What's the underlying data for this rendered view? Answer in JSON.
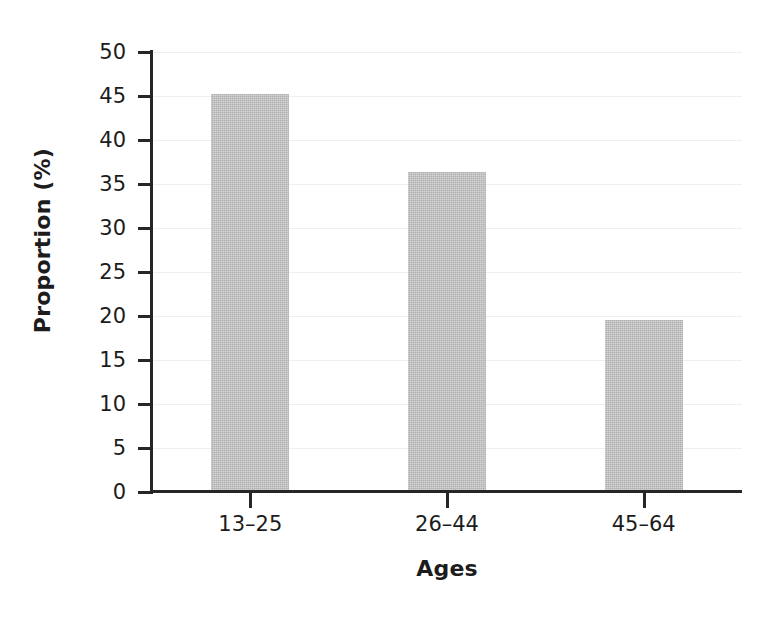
{
  "chart_data": {
    "type": "bar",
    "title": "",
    "subtitle": "",
    "categories": [
      "13–25",
      "26–44",
      "45–64"
    ],
    "values": [
      45.2,
      36.4,
      19.5
    ],
    "xlabel": "Ages",
    "ylabel": "Proportion (%)",
    "ylim": [
      0,
      50
    ],
    "ytick_labels": [
      "0",
      "5",
      "10",
      "15",
      "20",
      "25",
      "30",
      "35",
      "40",
      "45",
      "50"
    ],
    "ytick_values": [
      0,
      5,
      10,
      15,
      20,
      25,
      30,
      35,
      40,
      45,
      50
    ],
    "grid": true,
    "legend": "none",
    "bar_color": "#bdbdbd",
    "axis_color": "#262626",
    "grid_color": "#f1efed",
    "background": "#ffffff"
  }
}
